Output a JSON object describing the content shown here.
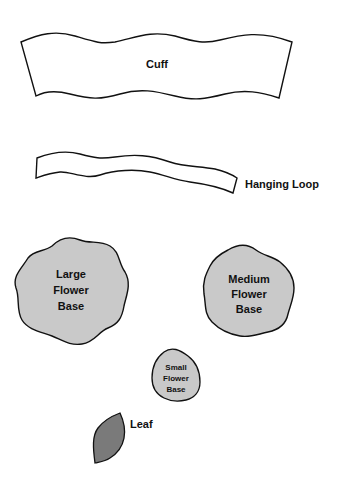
{
  "pattern_pieces": {
    "cuff": {
      "label": "Cuff"
    },
    "hanging_loop": {
      "label": "Hanging Loop"
    },
    "large_flower_base": {
      "line1": "Large",
      "line2": "Flower",
      "line3": "Base"
    },
    "medium_flower_base": {
      "line1": "Medium",
      "line2": "Flower",
      "line3": "Base"
    },
    "small_flower_base": {
      "line1": "Small",
      "line2": "Flower",
      "line3": "Base"
    },
    "leaf": {
      "label": "Leaf"
    }
  },
  "colors": {
    "flower_fill": "#c9c9c9",
    "leaf_fill": "#7a7a7a",
    "outline": "#111111"
  }
}
